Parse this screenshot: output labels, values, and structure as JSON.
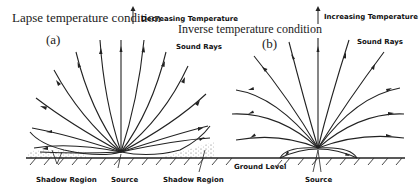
{
  "panel_a": {
    "condition_title": "Lapse temperature condition",
    "temperature_trend": "Decreasing Temperature",
    "label": "(a)",
    "rays_label": "Sound Rays",
    "shadow_left": "Shadow Region",
    "source": "Source",
    "shadow_right": "Shadow Region"
  },
  "panel_b": {
    "condition_title": "Inverse temperature condition",
    "temperature_trend": "Increasing Temperature",
    "label": "(b)",
    "rays_label": "Sound Rays",
    "ground": "Ground Level",
    "source": "Source"
  }
}
